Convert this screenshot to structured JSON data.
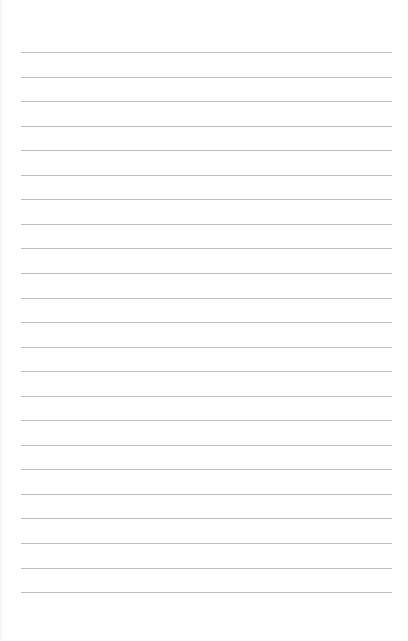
{
  "page": {
    "type": "lined-paper",
    "background": "#fefefe",
    "rule_color": "#bdbdbd",
    "rule_count": 23,
    "first_rule_y": 52,
    "rule_spacing": 24.55,
    "rule_left": 21,
    "rule_width": 371
  }
}
